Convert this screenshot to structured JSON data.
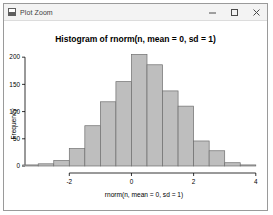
{
  "window": {
    "title": "Plot Zoom",
    "app_icon": "plot-icon",
    "controls": {
      "minimize": "–",
      "maximize": "□",
      "close": "✕"
    }
  },
  "chart_data": {
    "type": "bar",
    "title": "Histogram of rnorm(n, mean = 0, sd = 1)",
    "xlabel": "rnorm(n, mean = 0, sd = 1)",
    "ylabel": "Frequency",
    "xlim": [
      -3.2,
      4.2
    ],
    "ylim": [
      0,
      215
    ],
    "xticks": [
      -2,
      0,
      2,
      4
    ],
    "xtick_labels": [
      "-2",
      "0",
      "2",
      "4"
    ],
    "yticks": [
      0,
      50,
      100,
      150,
      200
    ],
    "ytick_labels": [
      "0",
      "50",
      "100",
      "150",
      "200"
    ],
    "grid": false,
    "legend": "none",
    "bar_fill": "#bebebe",
    "bar_stroke": "#6e6e6e",
    "bin_width": 0.5,
    "bin_starts": [
      -3.5,
      -3.0,
      -2.5,
      -2.0,
      -1.5,
      -1.0,
      -0.5,
      0.0,
      0.5,
      1.0,
      1.5,
      2.0,
      2.5,
      3.0,
      3.5
    ],
    "categories": [
      "-3.5",
      "-3.0",
      "-2.5",
      "-2.0",
      "-1.5",
      "-1.0",
      "-0.5",
      "0.0",
      "0.5",
      "1.0",
      "1.5",
      "2.0",
      "2.5",
      "3.0",
      "3.5"
    ],
    "values": [
      2,
      4,
      10,
      32,
      74,
      118,
      155,
      205,
      186,
      138,
      110,
      46,
      28,
      6,
      2
    ]
  }
}
